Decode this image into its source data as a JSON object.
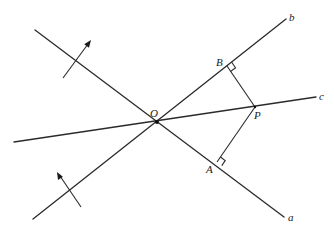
{
  "figure": {
    "type": "geometry-diagram",
    "stroke_color": "#2a2a2a",
    "background": "#ffffff"
  },
  "labels": {
    "O": "O",
    "A": "A",
    "B": "B",
    "P": "P",
    "a": "a",
    "b": "b",
    "c": "c"
  },
  "points": {
    "O": [
      157,
      122
    ],
    "A": [
      217,
      162
    ],
    "B": [
      227,
      66
    ],
    "P": [
      255,
      107
    ]
  },
  "lines": {
    "a": {
      "from": [
        35,
        30
      ],
      "to": [
        284,
        217
      ],
      "label": "a"
    },
    "b": {
      "from": [
        33,
        219
      ],
      "to": [
        286,
        19
      ],
      "label": "b"
    },
    "c": {
      "from": [
        14,
        142
      ],
      "to": [
        316,
        97
      ],
      "label": "c"
    },
    "PA": {
      "from": [
        255,
        107
      ],
      "to": [
        217,
        162
      ]
    },
    "PB": {
      "from": [
        255,
        107
      ],
      "to": [
        227,
        66
      ]
    }
  },
  "arrows": [
    {
      "name": "normal-arrow-line-a",
      "from": [
        63,
        78
      ],
      "to": [
        91,
        40
      ]
    },
    {
      "name": "normal-arrow-line-b",
      "from": [
        81,
        207
      ],
      "to": [
        57,
        172
      ]
    }
  ],
  "right_angle_marks": [
    "A",
    "B"
  ]
}
